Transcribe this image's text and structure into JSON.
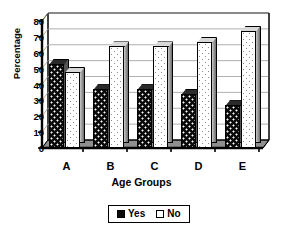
{
  "chart_data": {
    "type": "bar",
    "title": "",
    "xlabel": "Age Groups",
    "ylabel": "Percentage",
    "categories": [
      "A",
      "B",
      "C",
      "D",
      "E"
    ],
    "series": [
      {
        "name": "Yes",
        "values": [
          53,
          37,
          37,
          34,
          27
        ]
      },
      {
        "name": "No",
        "values": [
          48,
          64,
          64,
          67,
          74
        ]
      }
    ],
    "ylim": [
      0,
      80
    ],
    "ytick_step": 10,
    "ytick_labels": [
      "80",
      "70",
      "60",
      "50",
      "40",
      "30",
      "20",
      "10",
      "0"
    ],
    "grid": true,
    "legend_position": "bottom-center",
    "style": "3d-clustered-column",
    "colors": {
      "yes": "#0b0b0b",
      "no": "#ffffff",
      "axis": "#000000",
      "grid": "#b0b0b0"
    }
  },
  "legend": {
    "items": [
      {
        "label": "Yes",
        "swatch": "dark-speckled-swatch"
      },
      {
        "label": "No",
        "swatch": "white-dotted-swatch"
      }
    ]
  },
  "axes": {
    "y_title": "Percentage",
    "x_title": "Age Groups"
  }
}
